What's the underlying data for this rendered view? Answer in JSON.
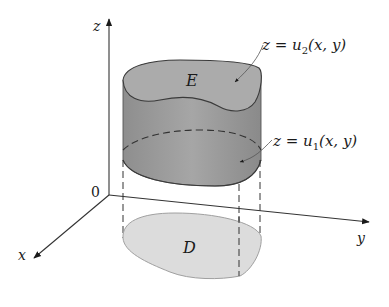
{
  "figure": {
    "axes": {
      "z_label": "z",
      "x_label": "x",
      "y_label": "y",
      "origin_label": "0"
    },
    "solid": {
      "label": "E",
      "top_surface": {
        "lhs": "z = u",
        "subscript": "2",
        "args": "(x, y)"
      },
      "bottom_surface": {
        "lhs": "z = u",
        "subscript": "1",
        "args": "(x, y)"
      }
    },
    "region": {
      "label": "D"
    },
    "colors": {
      "solid_side": "#9a9a9a",
      "solid_top": "#a8a8a8",
      "region_fill": "#dcdcdc",
      "region_edge": "#a0a0a0",
      "lines": "#333333"
    }
  }
}
